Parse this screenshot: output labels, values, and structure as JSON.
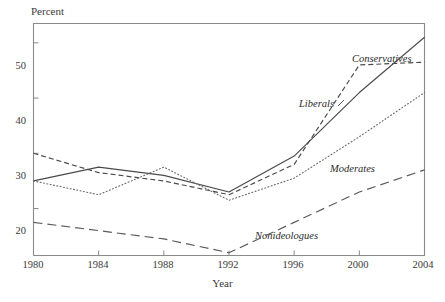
{
  "chart_data": {
    "type": "line",
    "title": "",
    "xlabel": "Year",
    "ylabel": "Percent",
    "x": [
      1980,
      1984,
      1988,
      1992,
      1996,
      2000,
      2004
    ],
    "xlim": [
      1980,
      2004
    ],
    "ylim": [
      11.5,
      53.5
    ],
    "grid": false,
    "legend_position": "inline-annotations",
    "xticks": [
      "1980",
      "1984",
      "1988",
      "1992",
      "1996",
      "2000",
      "2004"
    ],
    "yticks": [
      "20",
      "30",
      "40",
      "50"
    ],
    "ytick_values": [
      20,
      30,
      40,
      50
    ],
    "series": [
      {
        "name": "Conservatives",
        "style": "solid",
        "color": "#4a4a4a",
        "values": [
          25.0,
          27.5,
          26.0,
          23.0,
          29.5,
          41.0,
          51.0
        ]
      },
      {
        "name": "Liberals",
        "style": "dashed",
        "color": "#4a4a4a",
        "values": [
          30.0,
          26.5,
          25.0,
          22.5,
          28.0,
          46.0,
          46.5
        ]
      },
      {
        "name": "Moderates",
        "style": "dotted",
        "color": "#6a6a6a",
        "values": [
          25.0,
          22.5,
          27.5,
          21.5,
          25.5,
          33.0,
          41.0
        ]
      },
      {
        "name": "Nonideologues",
        "style": "longdash",
        "color": "#5a5a5a",
        "values": [
          17.5,
          16.0,
          14.5,
          12.0,
          17.5,
          23.0,
          27.0
        ]
      }
    ]
  },
  "axes": {
    "ylabel": "Percent",
    "xlabel": "Year",
    "ytick_labels": [
      "50",
      "40",
      "30",
      "20"
    ],
    "xtick_labels": [
      "1980",
      "1984",
      "1988",
      "1992",
      "1996",
      "2000",
      "2004"
    ]
  },
  "annotations": {
    "conservatives": "Conservatives",
    "liberals": "Liberals",
    "moderates": "Moderates",
    "nonideologues": "Nonideologues"
  },
  "colors": {
    "frame": "#8a8a8a",
    "text": "#3a3a3a",
    "line": "#4a4a4a"
  }
}
